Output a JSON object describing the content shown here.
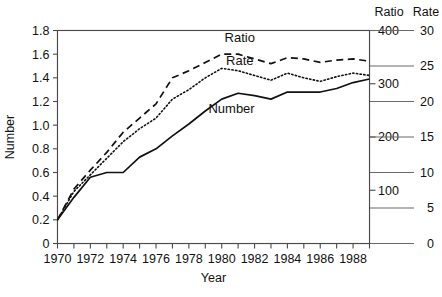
{
  "chart_data": {
    "type": "line",
    "title": "",
    "xlabel": "Year",
    "ylabel": "Number",
    "xlim": [
      1970,
      1989
    ],
    "ylim": [
      0,
      1.8
    ],
    "grid": false,
    "legend_position": "inline-labels",
    "x": [
      1970,
      1971,
      1972,
      1973,
      1974,
      1975,
      1976,
      1977,
      1978,
      1979,
      1980,
      1981,
      1982,
      1983,
      1984,
      1985,
      1986,
      1987,
      1988,
      1989
    ],
    "y_ticks": [
      "0",
      "0.2",
      "0.4",
      "0.6",
      "0.8",
      "1.0",
      "1.2",
      "1.4",
      "1.6",
      "1.8"
    ],
    "y_tick_values": [
      0,
      0.2,
      0.4,
      0.6,
      0.8,
      1.0,
      1.2,
      1.4,
      1.6,
      1.8
    ],
    "x_tick_labels": [
      "1970",
      "1972",
      "1974",
      "1976",
      "1978",
      "1980",
      "1982",
      "1984",
      "1986",
      "1988"
    ],
    "x_tick_values": [
      1970,
      1972,
      1974,
      1976,
      1978,
      1980,
      1982,
      1984,
      1986,
      1988
    ],
    "secondary_axes": [
      {
        "name": "Ratio",
        "header": "Ratio",
        "ticks": [
          "100",
          "200",
          "300",
          "400"
        ],
        "tick_values": [
          100,
          200,
          300,
          400
        ],
        "axis_min": 0,
        "axis_max": 400,
        "axis_max_at_top": true
      },
      {
        "name": "Rate",
        "header": "Rate",
        "ticks": [
          "0",
          "5",
          "10",
          "15",
          "20",
          "25",
          "30"
        ],
        "tick_values": [
          0,
          5,
          10,
          15,
          20,
          25,
          30
        ],
        "axis_min": 0,
        "axis_max": 30,
        "axis_max_at_top": true
      }
    ],
    "series": [
      {
        "name": "Ratio",
        "label": "Ratio",
        "style": "dashed",
        "axis": "Ratio",
        "label_x": 1981.1,
        "label_y": 1.705,
        "values": [
          0.2,
          0.46,
          0.62,
          0.77,
          0.94,
          1.06,
          1.18,
          1.4,
          1.46,
          1.53,
          1.6,
          1.6,
          1.56,
          1.52,
          1.57,
          1.56,
          1.53,
          1.55,
          1.56,
          1.54
        ]
      },
      {
        "name": "Rate",
        "label": "Rate",
        "style": "dotted",
        "axis": "Rate",
        "label_x": 1981.1,
        "label_y": 1.505,
        "values": [
          0.2,
          0.44,
          0.58,
          0.72,
          0.86,
          0.97,
          1.06,
          1.22,
          1.3,
          1.4,
          1.48,
          1.46,
          1.42,
          1.38,
          1.44,
          1.4,
          1.37,
          1.41,
          1.44,
          1.42
        ]
      },
      {
        "name": "Number",
        "label": "Number",
        "style": "solid",
        "axis": "Number",
        "label_x": 1980.6,
        "label_y": 1.105,
        "values": [
          0.2,
          0.39,
          0.56,
          0.6,
          0.6,
          0.73,
          0.8,
          0.91,
          1.01,
          1.12,
          1.22,
          1.27,
          1.25,
          1.22,
          1.28,
          1.28,
          1.28,
          1.31,
          1.36,
          1.39
        ]
      }
    ]
  }
}
